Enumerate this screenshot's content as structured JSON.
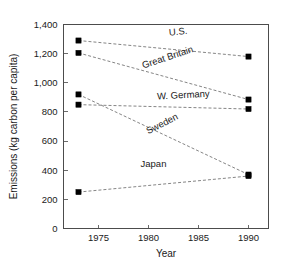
{
  "chart_data": {
    "type": "line",
    "title": "",
    "xlabel": "Year",
    "ylabel": "Emissions (kg carbon per capita)",
    "x": [
      1973,
      1990
    ],
    "xlim": [
      1971.5,
      1992.0
    ],
    "ylim": [
      0,
      1400
    ],
    "xticks": [
      1975,
      1980,
      1985,
      1990
    ],
    "xticklabels": [
      "1975",
      "1980",
      "1985",
      "1990"
    ],
    "yticks": [
      0,
      200,
      400,
      600,
      800,
      1000,
      1200,
      1400
    ],
    "yticklabels": [
      "0",
      "200",
      "400",
      "600",
      "800",
      "1,000",
      "1,200",
      "1,400"
    ],
    "grid": false,
    "legend_position": "inline-labels",
    "marker": "filled-square",
    "line_style": "dashed",
    "series": [
      {
        "name": "U.S.",
        "values": [
          1290,
          1180
        ]
      },
      {
        "name": "Great Britain",
        "values": [
          1205,
          885
        ]
      },
      {
        "name": "W. Germany",
        "values": [
          850,
          820
        ]
      },
      {
        "name": "Sweden",
        "values": [
          920,
          370
        ]
      },
      {
        "name": "Japan",
        "values": [
          250,
          360
        ]
      }
    ],
    "annotations": [
      {
        "text": "U.S.",
        "x": 1983.0,
        "y": 1330,
        "rotation": -6
      },
      {
        "text": "Great Britain",
        "x": 1982.0,
        "y": 1155,
        "rotation": -18
      },
      {
        "text": "W. Germany",
        "x": 1983.5,
        "y": 895,
        "rotation": -3
      },
      {
        "text": "Sweden",
        "x": 1981.5,
        "y": 700,
        "rotation": -27
      },
      {
        "text": "Japan",
        "x": 1980.5,
        "y": 420,
        "rotation": 0
      }
    ]
  },
  "colors": {
    "marker": "#000000",
    "line": "#777777",
    "axis": "#4c4c4c",
    "text": "#1a1a1a",
    "background": "#ffffff"
  }
}
